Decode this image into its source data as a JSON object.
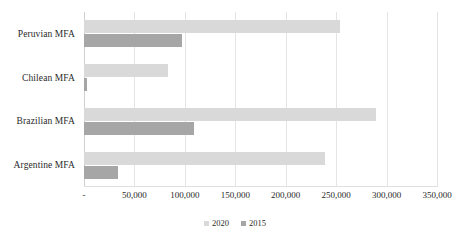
{
  "chart_data": {
    "type": "bar",
    "orientation": "horizontal",
    "title": "",
    "xlabel": "",
    "ylabel": "",
    "categories": [
      "Peruvian MFA",
      "Chilean MFA",
      "Brazilian MFA",
      "Argentine MFA"
    ],
    "series": [
      {
        "name": "2020",
        "color": "#d9d9d9",
        "values": [
          254000,
          83000,
          290000,
          239000
        ]
      },
      {
        "name": "2015",
        "color": "#a6a6a6",
        "values": [
          97000,
          3000,
          109000,
          34000
        ]
      }
    ],
    "xlim": [
      0,
      350000
    ],
    "xticks": [
      0,
      50000,
      100000,
      150000,
      200000,
      250000,
      300000,
      350000
    ],
    "xtick_labels": [
      "-",
      "50,000",
      "100,000",
      "150,000",
      "200,000",
      "250,000",
      "300,000",
      "350,000"
    ],
    "grid": true,
    "legend_position": "bottom"
  },
  "legend": {
    "items": [
      {
        "label": "2020",
        "color": "#d9d9d9"
      },
      {
        "label": "2015",
        "color": "#a6a6a6"
      }
    ]
  }
}
